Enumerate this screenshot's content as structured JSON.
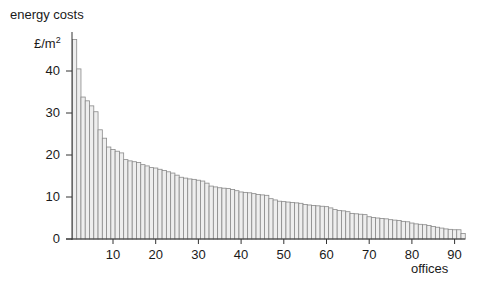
{
  "chart_data": {
    "type": "bar",
    "title": "energy costs",
    "ylabel": "£/m²",
    "ylabel_base": "£/m",
    "ylabel_sup": "2",
    "xlabel": "offices",
    "ylim": [
      0,
      48
    ],
    "xlim": [
      0.5,
      92.5
    ],
    "yticks": [
      0,
      10,
      20,
      30,
      40
    ],
    "xticks": [
      10,
      20,
      30,
      40,
      50,
      60,
      70,
      80,
      90
    ],
    "grid": false,
    "legend": null,
    "bar_fill": "#eeeeee",
    "bar_stroke": "#8a8a8a",
    "axis_color": "#333333",
    "x": [
      1,
      2,
      3,
      4,
      5,
      6,
      7,
      8,
      9,
      10,
      11,
      12,
      13,
      14,
      15,
      16,
      17,
      18,
      19,
      20,
      21,
      22,
      23,
      24,
      25,
      26,
      27,
      28,
      29,
      30,
      31,
      32,
      33,
      34,
      35,
      36,
      37,
      38,
      39,
      40,
      41,
      42,
      43,
      44,
      45,
      46,
      47,
      48,
      49,
      50,
      51,
      52,
      53,
      54,
      55,
      56,
      57,
      58,
      59,
      60,
      61,
      62,
      63,
      64,
      65,
      66,
      67,
      68,
      69,
      70,
      71,
      72,
      73,
      74,
      75,
      76,
      77,
      78,
      79,
      80,
      81,
      82,
      83,
      84,
      85,
      86,
      87,
      88,
      89,
      90,
      91,
      92
    ],
    "values": [
      47.5,
      40.5,
      33.8,
      32.9,
      31.7,
      30.3,
      26.0,
      24.0,
      21.9,
      21.3,
      20.9,
      20.5,
      18.9,
      18.6,
      18.4,
      18.2,
      17.7,
      17.4,
      17.0,
      16.9,
      16.6,
      16.3,
      16.0,
      15.7,
      15.2,
      14.7,
      14.5,
      14.3,
      14.2,
      14.0,
      13.8,
      13.3,
      12.6,
      12.4,
      12.2,
      12.1,
      12.0,
      11.8,
      11.5,
      11.2,
      11.1,
      11.0,
      10.8,
      10.6,
      10.5,
      10.4,
      9.6,
      9.3,
      9.0,
      8.9,
      8.8,
      8.7,
      8.6,
      8.5,
      8.2,
      8.1,
      8.0,
      7.9,
      7.8,
      7.7,
      7.4,
      7.0,
      6.8,
      6.7,
      6.5,
      6.1,
      6.0,
      5.9,
      5.8,
      5.3,
      5.1,
      5.0,
      4.9,
      4.8,
      4.6,
      4.5,
      4.4,
      4.2,
      4.1,
      3.8,
      3.6,
      3.5,
      3.4,
      3.2,
      3.0,
      2.8,
      2.6,
      2.4,
      2.3,
      2.2,
      2.2,
      1.3
    ]
  }
}
